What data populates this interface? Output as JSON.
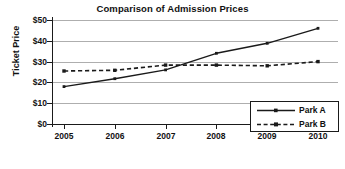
{
  "chart_data": {
    "type": "line",
    "title": "Comparison of Admission Prices",
    "xlabel": "",
    "ylabel": "Ticket Price",
    "categories": [
      "2005",
      "2006",
      "2007",
      "2008",
      "2009",
      "2010"
    ],
    "x": [
      2005,
      2006,
      2007,
      2008,
      2009,
      2010
    ],
    "series": [
      {
        "name": "Park A",
        "values": [
          18,
          21.8,
          26,
          34,
          38.8,
          46
        ],
        "style": "solid",
        "marker": "square",
        "color": "#1a1a1a"
      },
      {
        "name": "Park B",
        "values": [
          25.5,
          25.8,
          28.3,
          28.3,
          28,
          30
        ],
        "style": "dashed",
        "marker": "square",
        "color": "#1a1a1a"
      }
    ],
    "ylim": [
      0,
      50
    ],
    "ytick_values": [
      0,
      10,
      20,
      30,
      40,
      50
    ],
    "ytick_labels": [
      "$0",
      "$10",
      "$20",
      "$30",
      "$40",
      "$50"
    ],
    "grid": true,
    "grid_axis": "y",
    "grid_color": "#aeaeae",
    "legend_position": "bottom-right",
    "background": "#ffffff",
    "axis_color": "#1a1a1a"
  }
}
